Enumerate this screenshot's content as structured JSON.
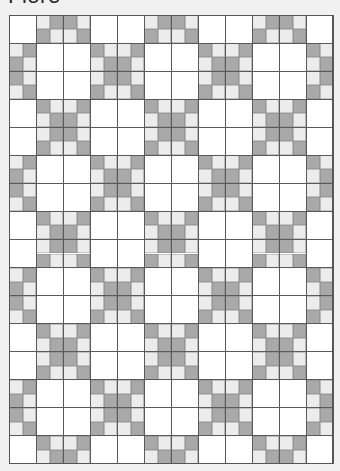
{
  "title": "Fiore",
  "quilt": {
    "columns": 24,
    "rows": 32,
    "cell_width": 13.5,
    "cell_height": 14.03,
    "block_size_cells": 2,
    "colors": {
      "W": "#ffffff",
      "L": "#ececec",
      "D": "#a9a9a9",
      "grid_line": "#5a5a5a"
    },
    "legend": {
      "W": "white patch",
      "L": "light gray patch",
      "D": "dark gray patch"
    },
    "grid": [
      "WWLDDLWWWWLDDLWWWWLDDLWW",
      "WWDLLDWWWWDLLDWWWWDLLDWW",
      "LDWWWWDLLDWWWWDLLDWWWWDL",
      "DLWWWWLDDLWWWWLDDLWWWWLD",
      "DLWWWWLDDLWWWWLDDLWWWWLD",
      "LDWWWWDLLDWWWWDLLDWWWWDL",
      "WWDLLDWWWWDLLDWWWWDLLDWW",
      "WWLDDLWWWWLDDLWWWWLDDLWW",
      "WWLDDLWWWWLDDLWWWWLDDLWW",
      "WWDLLDWWWWDLLDWWWWDLLDWW",
      "LDWWWWDLLDWWWWDLLDWWWWDL",
      "DLWWWWLDDLWWWWLDDLWWWWLD",
      "DLWWWWLDDLWWWWLDDLWWWWLD",
      "LDWWWWDLLDWWWWDLLDWWWWDL",
      "WWDLLDWWWWDLLDWWWWDLLDWW",
      "WWLDDLWWWWLDDLWWWWLDDLWW",
      "WWLDDLWWWWLDDLWWWWLDDLWW",
      "WWDLLDWWWWDLLDWWWWDLLDWW",
      "LDWWWWDLLDWWWWDLLDWWWWDL",
      "DLWWWWLDDLWWWWLDDLWWWWLD",
      "DLWWWWLDDLWWWWLDDLWWWWLD",
      "LDWWWWDLLDWWWWDLLDWWWWDL",
      "WWDLLDWWWWDLLDWWWWDLLDWW",
      "WWLDDLWWWWLDDLWWWWLDDLWW",
      "WWLDDLWWWWLDDLWWWWLDDLWW",
      "WWDLLDWWWWDLLDWWWWDLLDWW",
      "LDWWWWDLLDWWWWDLLDWWWWDL",
      "DLWWWWLDDLWWWWLDDLWWWWLD",
      "DLWWWWLDDLWWWWLDDLWWWWLD",
      "LDWWWWDLLDWWWWDLLDWWWWDL",
      "WWDLLDWWWWDLLDWWWWDLLDWW",
      "WWLDDLWWWWLDDLWWWWLDDLWW"
    ]
  }
}
